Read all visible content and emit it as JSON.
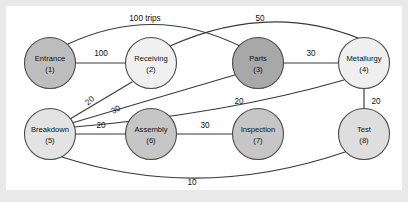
{
  "figure": {
    "background_color": "#ffffff",
    "page_color": "#e9e9e9",
    "edge_color": "#3a3a3a",
    "node_stroke_color": "#4a4a4a"
  },
  "chart_data": {
    "type": "diagram",
    "subtype": "weighted-undirected-network",
    "title": "",
    "units_note": "100 trips",
    "legend": [],
    "nodes": [
      {
        "id": 1,
        "label": "Entrance",
        "id_text": "(1)",
        "x": 44,
        "y": 57,
        "r": 25.5,
        "fill": "#bdbdbd"
      },
      {
        "id": 2,
        "label": "Receiving",
        "id_text": "(2)",
        "x": 145,
        "y": 57,
        "r": 25.5,
        "fill": "#f0f0f0"
      },
      {
        "id": 3,
        "label": "Parts",
        "id_text": "(3)",
        "x": 252,
        "y": 57,
        "r": 25.5,
        "fill": "#a8a8a8"
      },
      {
        "id": 4,
        "label": "Metallurgy",
        "id_text": "(4)",
        "x": 358,
        "y": 57,
        "r": 25.5,
        "fill": "#efefef"
      },
      {
        "id": 5,
        "label": "Breakdown",
        "id_text": "(5)",
        "x": 44,
        "y": 128,
        "r": 25.5,
        "fill": "#e3e3e3"
      },
      {
        "id": 6,
        "label": "Assembly",
        "id_text": "(6)",
        "x": 145,
        "y": 128,
        "r": 25.5,
        "fill": "#c6c6c6"
      },
      {
        "id": 7,
        "label": "Inspection",
        "id_text": "(7)",
        "x": 252,
        "y": 128,
        "r": 25.5,
        "fill": "#c6c6c6"
      },
      {
        "id": 8,
        "label": "Test",
        "id_text": "(8)",
        "x": 358,
        "y": 128,
        "r": 25.5,
        "fill": "#dedede"
      }
    ],
    "edges": [
      {
        "from": 1,
        "to": 2,
        "weight": "100",
        "value": 100,
        "shape": "straight",
        "label_x": 95,
        "label_y": 48,
        "rotate": 0,
        "path": "M 69.5 57 L 119.5 57"
      },
      {
        "from": 1,
        "to": 3,
        "weight": "100 trips",
        "value": 100,
        "shape": "arc",
        "label_x": 139,
        "label_y": 13,
        "rotate": 0,
        "path": "M 62 38 Q 150 -3 238 42"
      },
      {
        "from": 2,
        "to": 4,
        "weight": "50",
        "value": 50,
        "shape": "arc",
        "label_x": 254,
        "label_y": 13,
        "rotate": 0,
        "path": "M 164 40 Q 262 -4 352 32"
      },
      {
        "from": 3,
        "to": 4,
        "weight": "30",
        "value": 30,
        "shape": "straight",
        "label_x": 305,
        "label_y": 48,
        "rotate": 0,
        "path": "M 277.5 57 L 332.5 57"
      },
      {
        "from": 4,
        "to": 8,
        "weight": "20",
        "value": 20,
        "shape": "straight",
        "label_x": 370,
        "label_y": 96,
        "rotate": 0,
        "path": "M 358 82.5 L 358 102.5"
      },
      {
        "from": 5,
        "to": 2,
        "weight": "20",
        "value": 20,
        "shape": "straight",
        "label_x": 84,
        "label_y": 95,
        "rotate": -42,
        "path": "M 64 113 L 126 76"
      },
      {
        "from": 5,
        "to": 3,
        "weight": "30",
        "value": 30,
        "shape": "straight",
        "label_x": 110,
        "label_y": 104,
        "rotate": -28,
        "path": "M 66 117 L 232 68"
      },
      {
        "from": 5,
        "to": 4,
        "weight": "20",
        "value": 20,
        "shape": "arc",
        "label_x": 233,
        "label_y": 96,
        "rotate": 0,
        "path": "M 68 121 Q 220 108 338 74"
      },
      {
        "from": 5,
        "to": 6,
        "weight": "20",
        "value": 20,
        "shape": "straight",
        "label_x": 95,
        "label_y": 120,
        "rotate": 0,
        "path": "M 69.5 128 L 119.5 128"
      },
      {
        "from": 6,
        "to": 7,
        "weight": "30",
        "value": 30,
        "shape": "straight",
        "label_x": 199,
        "label_y": 120,
        "rotate": 0,
        "path": "M 170.5 128 L 226.5 128"
      },
      {
        "from": 5,
        "to": 8,
        "weight": "10",
        "value": 10,
        "shape": "arc",
        "label_x": 186,
        "label_y": 177,
        "rotate": 0,
        "path": "M 56 151 Q 195 196 342 145"
      }
    ]
  }
}
